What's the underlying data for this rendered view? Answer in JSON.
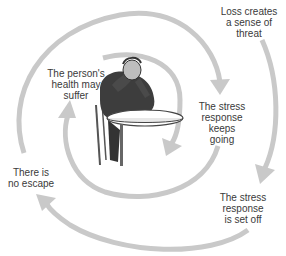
{
  "diagram": {
    "type": "cycle-spiral",
    "arrow_color": "#c9c9c9",
    "text_color": "#3a3a3a",
    "illustration": "man-sitting-at-table-head-in-hands",
    "steps": [
      {
        "id": "loss",
        "label": "Loss creates\na sense of\nthreat"
      },
      {
        "id": "set-off",
        "label": "The stress\nresponse\nis set off"
      },
      {
        "id": "no-escape",
        "label": "There is\nno escape"
      },
      {
        "id": "keeps-going",
        "label": "The stress\nresponse\nkeeps\ngoing"
      },
      {
        "id": "health",
        "label": "The person's\nhealth may\nsuffer"
      }
    ]
  }
}
